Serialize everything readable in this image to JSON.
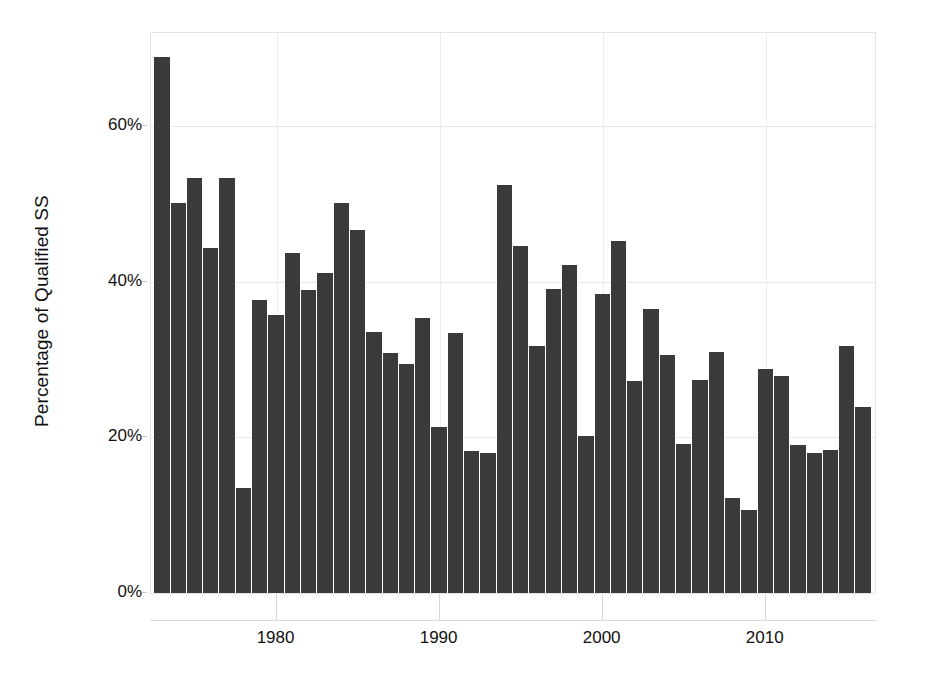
{
  "chart_data": {
    "type": "bar",
    "title": "",
    "subtitle": "",
    "xlabel": "",
    "ylabel": "Percentage of Qualified SS",
    "xlim": [
      1972.3,
      2016.7
    ],
    "ylim": [
      0,
      72
    ],
    "grid": true,
    "legend": "none",
    "bar_color": "#3a3a3a",
    "y_ticks": [
      {
        "value": 0,
        "label": "0%"
      },
      {
        "value": 20,
        "label": "20%"
      },
      {
        "value": 40,
        "label": "40%"
      },
      {
        "value": 60,
        "label": "60%"
      }
    ],
    "x_ticks": [
      {
        "value": 1980,
        "label": "1980"
      },
      {
        "value": 1990,
        "label": "1990"
      },
      {
        "value": 2000,
        "label": "2000"
      },
      {
        "value": 2010,
        "label": "2010"
      }
    ],
    "categories": [
      1973,
      1974,
      1975,
      1976,
      1977,
      1978,
      1979,
      1980,
      1981,
      1982,
      1983,
      1984,
      1985,
      1986,
      1987,
      1988,
      1989,
      1990,
      1991,
      1992,
      1993,
      1994,
      1995,
      1996,
      1997,
      1998,
      1999,
      2000,
      2001,
      2002,
      2003,
      2004,
      2005,
      2006,
      2007,
      2008,
      2009,
      2010,
      2011,
      2012,
      2013,
      2014,
      2015,
      2016
    ],
    "values": [
      68.9,
      50.1,
      53.4,
      44.4,
      53.4,
      13.5,
      37.7,
      35.8,
      43.7,
      39.0,
      41.2,
      50.2,
      46.7,
      33.5,
      30.8,
      29.5,
      35.4,
      21.4,
      33.4,
      18.3,
      18.0,
      52.5,
      44.6,
      31.8,
      39.1,
      42.2,
      20.2,
      38.4,
      45.2,
      27.3,
      36.5,
      30.6,
      19.2,
      27.4,
      31.0,
      12.2,
      10.7,
      28.8,
      27.9,
      19.0,
      18.0,
      18.4,
      31.7,
      23.9
    ],
    "units": "percent"
  }
}
